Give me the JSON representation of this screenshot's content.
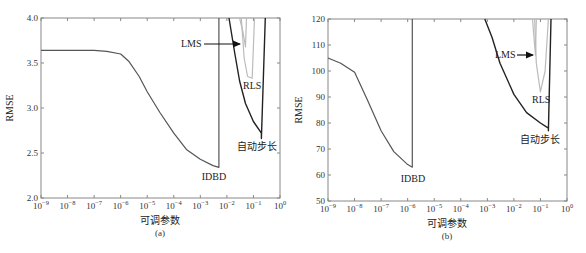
{
  "chart_data": [
    {
      "id": "a",
      "type": "line",
      "panel_label": "(a)",
      "xlabel": "可调参数",
      "ylabel": "RMSE",
      "xscale": "log",
      "xlim": [
        1e-09,
        1
      ],
      "ylim": [
        2.0,
        4.0
      ],
      "xtick_labels": [
        "10^-9",
        "10^-8",
        "10^-7",
        "10^-6",
        "10^-5",
        "10^-4",
        "10^-3",
        "10^-2",
        "10^-1",
        "10^0"
      ],
      "ytick_labels": [
        "2.0",
        "2.5",
        "3.0",
        "3.5",
        "4.0"
      ],
      "grid": false,
      "series": [
        {
          "name": "IDBD",
          "color": "#555555",
          "x": [
            1e-09,
            1e-08,
            1e-07,
            3e-07,
            1e-06,
            2e-06,
            5e-06,
            1e-05,
            3e-05,
            0.0001,
            0.0003,
            0.001,
            0.003,
            0.005,
            0.005
          ],
          "y": [
            3.64,
            3.64,
            3.64,
            3.63,
            3.6,
            3.52,
            3.35,
            3.18,
            2.95,
            2.72,
            2.54,
            2.43,
            2.36,
            2.34,
            4.0
          ]
        },
        {
          "name": "LMS",
          "color": "#bbbbbb",
          "x": [
            0.03,
            0.04,
            0.05,
            0.055
          ],
          "y": [
            4.0,
            3.85,
            3.68,
            4.0
          ]
        },
        {
          "name": "RLS",
          "color": "#bbbbbb",
          "x": [
            0.035,
            0.045,
            0.06,
            0.09,
            0.11
          ],
          "y": [
            4.0,
            3.55,
            3.35,
            3.33,
            4.0
          ]
        },
        {
          "name": "自动步长",
          "color": "#222222",
          "x": [
            0.012,
            0.02,
            0.03,
            0.05,
            0.1,
            0.2,
            0.2,
            0.28
          ],
          "y": [
            4.0,
            3.6,
            3.3,
            3.05,
            2.85,
            2.72,
            2.66,
            4.0
          ]
        }
      ],
      "annotations": [
        {
          "text": "LMS",
          "arrow_to": [
            0.05,
            3.68
          ]
        },
        {
          "text": "RLS",
          "at": [
            0.08,
            3.2
          ]
        },
        {
          "text": "IDBD",
          "at": [
            0.002,
            2.22
          ]
        },
        {
          "text": "自动步长",
          "at": [
            0.2,
            2.55
          ]
        }
      ]
    },
    {
      "id": "b",
      "type": "line",
      "panel_label": "(b)",
      "xlabel": "可调参数",
      "ylabel": "RMSE",
      "xscale": "log",
      "xlim": [
        1e-09,
        1
      ],
      "ylim": [
        50,
        120
      ],
      "xtick_labels": [
        "10^-9",
        "10^-8",
        "10^-7",
        "10^-6",
        "10^-5",
        "10^-4",
        "10^-3",
        "10^-2",
        "10^-1",
        "10^0"
      ],
      "ytick_labels": [
        "50",
        "60",
        "70",
        "80",
        "90",
        "100",
        "110",
        "120"
      ],
      "grid": false,
      "series": [
        {
          "name": "IDBD",
          "color": "#555555",
          "x": [
            1e-09,
            3e-09,
            1e-08,
            3e-08,
            1e-07,
            3e-07,
            1e-06,
            1.5e-06,
            1.5e-06
          ],
          "y": [
            105,
            103,
            99.5,
            89,
            77,
            69,
            64,
            63,
            120
          ]
        },
        {
          "name": "LMS",
          "color": "#bbbbbb",
          "x": [
            0.05,
            0.06,
            0.065,
            0.07
          ],
          "y": [
            120,
            110,
            106,
            120
          ]
        },
        {
          "name": "RLS",
          "color": "#bbbbbb",
          "x": [
            0.06,
            0.07,
            0.1,
            0.15,
            0.2
          ],
          "y": [
            120,
            103,
            92,
            100,
            120
          ]
        },
        {
          "name": "自动步长",
          "color": "#222222",
          "x": [
            0.0008,
            0.0015,
            0.003,
            0.01,
            0.03,
            0.1,
            0.2,
            0.2,
            0.25
          ],
          "y": [
            120,
            113,
            103,
            91,
            84,
            80,
            78,
            77,
            120
          ]
        }
      ],
      "annotations": [
        {
          "text": "LMS",
          "arrow_to": [
            0.065,
            106
          ]
        },
        {
          "text": "RLS",
          "at": [
            0.12,
            83
          ]
        },
        {
          "text": "IDBD",
          "at": [
            1.5e-06,
            57
          ]
        },
        {
          "text": "自动步长",
          "at": [
            0.15,
            73
          ]
        }
      ]
    }
  ],
  "panels": [
    {
      "ylabel": "RMSE",
      "xlabel": "可调参数",
      "caption": "(a)",
      "labels": {
        "lms": "LMS",
        "rls": "RLS",
        "idbd": "IDBD",
        "auto": "自动步长"
      }
    },
    {
      "ylabel": "RMSE",
      "xlabel": "可调参数",
      "caption": "(b)",
      "labels": {
        "lms": "LMS",
        "rls": "RLS",
        "idbd": "IDBD",
        "auto": "自动步长"
      }
    }
  ]
}
